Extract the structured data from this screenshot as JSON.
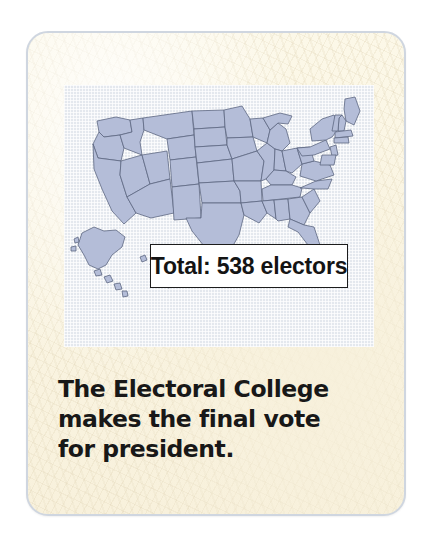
{
  "card": {
    "background_color": "#fbf6e4",
    "border_color": "#cfd6e0"
  },
  "map": {
    "name": "united-states-map",
    "panel_background_color": "#e4e8ee",
    "state_fill_color": "#b4bdd8",
    "state_border_color": "#5d6782",
    "includes_alaska": true,
    "includes_hawaii": true,
    "callout": {
      "text": "Total: 538 electors",
      "total_electors": 538,
      "box_background_color": "#ffffff",
      "box_border_color": "#1c1c1c"
    }
  },
  "caption": {
    "full_text": "The Electoral College makes the final vote for president.",
    "lines": [
      "The Electoral College",
      "makes the final vote",
      "for president."
    ]
  }
}
